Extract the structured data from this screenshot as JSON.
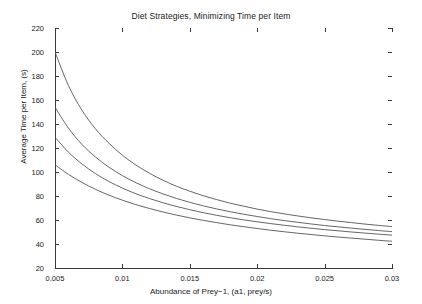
{
  "chart_data": {
    "type": "line",
    "title": "Diet Strategies, Minimizing Time per Item",
    "xlabel": "Abundance of Prey−1, (a1, prey/s)",
    "ylabel": "Average Time per Item, (s)",
    "xlim": [
      0.005,
      0.03
    ],
    "ylim": [
      20,
      220
    ],
    "grid": false,
    "legend": null,
    "xticks": [
      0.005,
      0.01,
      0.015,
      0.02,
      0.025,
      0.03
    ],
    "xtick_labels": [
      "0.005",
      "0.01",
      "0.015",
      "0.02",
      "0.025",
      "0.03"
    ],
    "yticks": [
      20,
      40,
      60,
      80,
      100,
      120,
      140,
      160,
      180,
      200,
      220
    ],
    "ytick_labels": [
      "20",
      "40",
      "60",
      "80",
      "100",
      "120",
      "140",
      "160",
      "180",
      "200",
      "220"
    ],
    "line_color": "#555555",
    "x": [
      0.005,
      0.006,
      0.007,
      0.008,
      0.009,
      0.01,
      0.011,
      0.012,
      0.013,
      0.014,
      0.015,
      0.016,
      0.017,
      0.018,
      0.019,
      0.02,
      0.021,
      0.022,
      0.023,
      0.024,
      0.025,
      0.026,
      0.027,
      0.028,
      0.029,
      0.03
    ],
    "series": [
      {
        "name": "strategy-1",
        "values": [
          200.0,
          172.0,
          151.5,
          136.0,
          124.0,
          114.0,
          105.8,
          99.0,
          93.2,
          88.2,
          84.0,
          80.2,
          77.0,
          74.0,
          71.5,
          69.1,
          67.0,
          65.1,
          63.4,
          61.8,
          60.4,
          59.0,
          57.8,
          56.6,
          55.5,
          54.5
        ]
      },
      {
        "name": "strategy-2",
        "values": [
          154.0,
          136.5,
          123.0,
          112.5,
          104.0,
          97.0,
          91.1,
          86.1,
          81.8,
          78.0,
          74.7,
          71.8,
          69.2,
          66.9,
          64.8,
          62.9,
          61.1,
          59.5,
          58.1,
          56.7,
          55.4,
          54.3,
          53.2,
          52.2,
          51.2,
          50.3
        ]
      },
      {
        "name": "strategy-3",
        "values": [
          129.0,
          116.5,
          106.7,
          98.7,
          92.1,
          86.6,
          81.9,
          77.9,
          74.4,
          71.3,
          68.6,
          66.1,
          63.9,
          61.9,
          60.1,
          58.5,
          57.0,
          55.6,
          54.3,
          53.1,
          52.0,
          51.0,
          50.0,
          49.1,
          48.2,
          47.4
        ]
      },
      {
        "name": "strategy-4",
        "values": [
          106.0,
          98.0,
          91.3,
          85.6,
          80.7,
          76.5,
          72.8,
          69.6,
          66.7,
          64.1,
          61.8,
          59.7,
          57.8,
          56.0,
          54.4,
          52.9,
          51.5,
          50.2,
          49.0,
          47.9,
          46.8,
          45.8,
          44.9,
          44.0,
          43.1,
          42.3
        ]
      }
    ]
  },
  "watermark": {
    "text": ""
  }
}
